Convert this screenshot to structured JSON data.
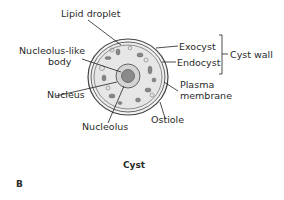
{
  "diagram": {
    "title": "Cyst",
    "panel_letter": "B",
    "labels": {
      "lipid_droplet": "Lipid droplet",
      "nucleolus_like_1": "Nucleolus-like",
      "nucleolus_like_2": "body",
      "nucleus": "Nucleus",
      "nucleolus": "Nucleolus",
      "exocyst": "Exocyst",
      "endocyst": "Endocyst",
      "cyst_wall": "Cyst wall",
      "plasma_1": "Plasma",
      "plasma_2": "membrane",
      "ostiole": "Ostiole"
    }
  }
}
